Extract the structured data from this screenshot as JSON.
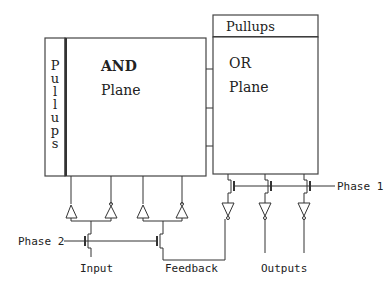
{
  "diagram": {
    "blocks": {
      "and_pullups": {
        "label": "Pullups",
        "chars": [
          "P",
          "u",
          "l",
          "l",
          "u",
          "p",
          "s"
        ]
      },
      "and_plane": {
        "line1": "AND",
        "line2": "Plane"
      },
      "or_pullups": {
        "label": "Pullups"
      },
      "or_plane": {
        "line1": "OR",
        "line2": "Plane"
      }
    },
    "signals": {
      "phase2": "Phase 2",
      "phase1": "Phase 1",
      "input": "Input",
      "feedback": "Feedback",
      "outputs": "Outputs"
    },
    "colors": {
      "line": "#333333",
      "background": "#ffffff"
    }
  }
}
